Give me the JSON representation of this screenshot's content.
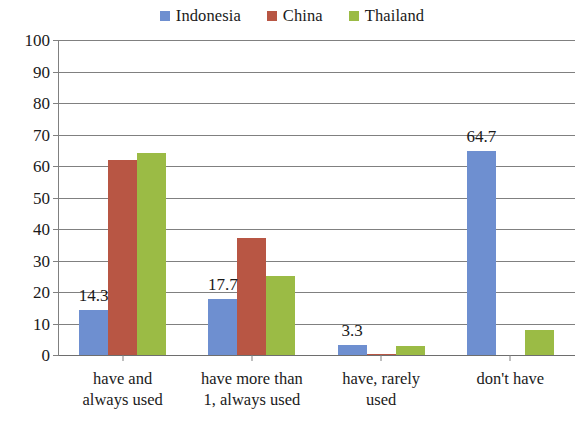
{
  "chart_data": {
    "type": "bar",
    "title": "",
    "subtitle": "",
    "xlabel": "",
    "ylabel": "",
    "ylim": [
      0,
      100
    ],
    "ytick_step": 10,
    "yticks": [
      "100",
      "90",
      "80",
      "70",
      "60",
      "50",
      "40",
      "30",
      "20",
      "10",
      "0"
    ],
    "grid": true,
    "legend_position": "top-center",
    "categories": [
      "have and always used",
      "have more than 1, always used",
      "have, rarely used",
      "don't have"
    ],
    "category_lines": [
      [
        "have and",
        "always used"
      ],
      [
        "have more than",
        "1, always used"
      ],
      [
        "have, rarely",
        "used"
      ],
      [
        "don't have",
        ""
      ]
    ],
    "series": [
      {
        "name": "Indonesia",
        "color": "#6E8FD0",
        "values": [
          14.3,
          17.7,
          3.3,
          64.7
        ],
        "data_labels": [
          "14.3",
          "17.7",
          "3.3",
          "64.7"
        ]
      },
      {
        "name": "China",
        "color": "#B85644",
        "values": [
          62.0,
          37.0,
          0.4,
          0.0
        ],
        "data_labels": [
          "",
          "",
          "",
          ""
        ]
      },
      {
        "name": "Thailand",
        "color": "#9BBB45",
        "values": [
          64.0,
          25.0,
          2.8,
          7.8
        ],
        "data_labels": [
          "",
          "",
          "",
          ""
        ]
      }
    ]
  }
}
